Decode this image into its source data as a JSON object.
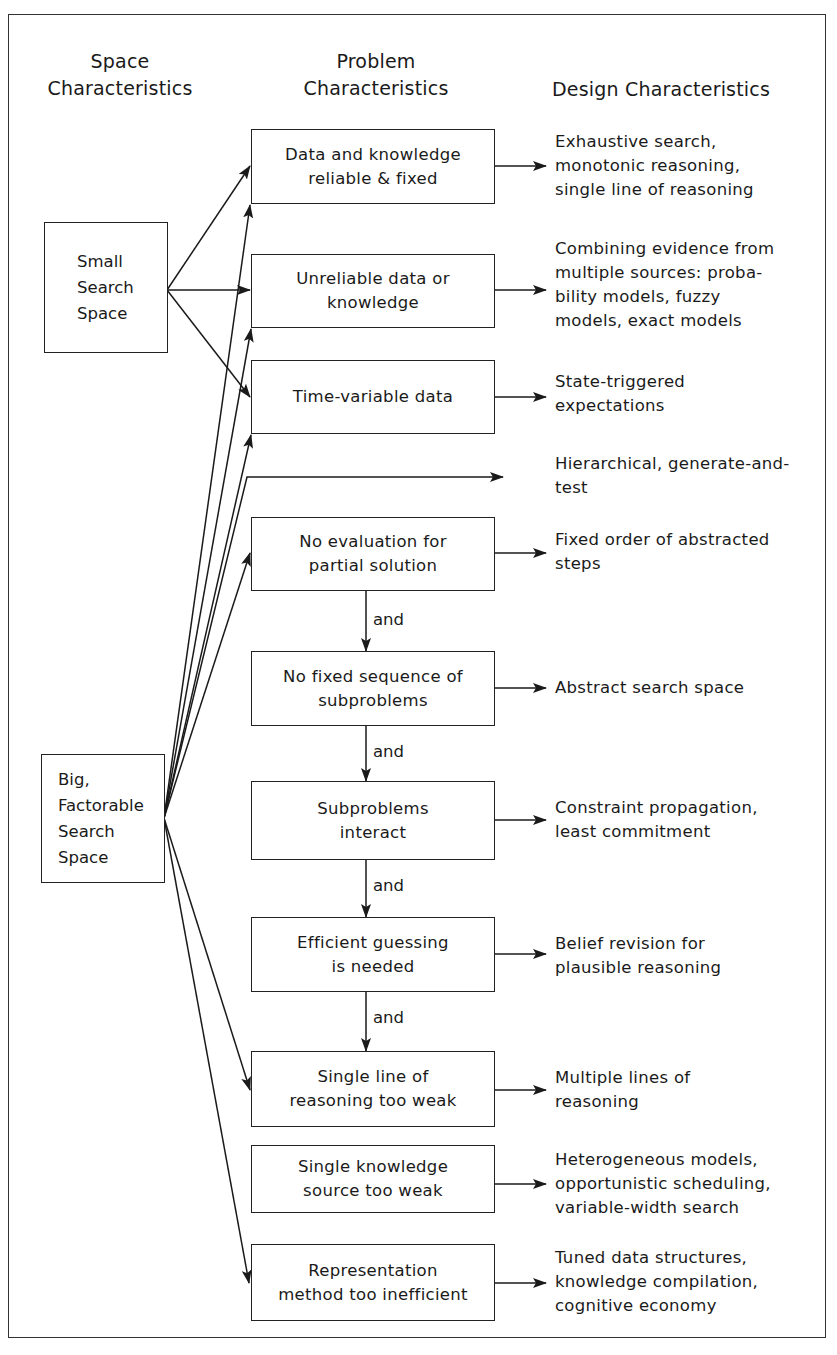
{
  "headers": {
    "space": [
      "Space",
      "Characteristics"
    ],
    "problem": [
      "Problem",
      "Characteristics"
    ],
    "design": "Design Characteristics"
  },
  "space_nodes": [
    {
      "id": "small",
      "lines": [
        "Small",
        "Search",
        "Space"
      ]
    },
    {
      "id": "big",
      "lines": [
        "Big,",
        "Factorable",
        "Search",
        "Space"
      ]
    }
  ],
  "problems": [
    {
      "lines": [
        "Data and knowledge",
        "reliable & fixed"
      ],
      "from": "small"
    },
    {
      "lines": [
        "Unreliable data or",
        "knowledge"
      ],
      "from": "small"
    },
    {
      "lines": [
        "Time-variable data"
      ],
      "from": "small"
    },
    {
      "lines": [
        "No evaluation for",
        "partial solution"
      ],
      "from": "big"
    },
    {
      "lines": [
        "No fixed sequence of",
        "subproblems"
      ],
      "from": "and"
    },
    {
      "lines": [
        "Subproblems",
        "interact"
      ],
      "from": "and"
    },
    {
      "lines": [
        "Efficient guessing",
        "is needed"
      ],
      "from": "and"
    },
    {
      "lines": [
        "Single line of",
        "reasoning too weak"
      ],
      "from": "big+and"
    },
    {
      "lines": [
        "Single knowledge",
        "source too weak"
      ],
      "from": "none"
    },
    {
      "lines": [
        "Representation",
        "method too inefficient"
      ],
      "from": "big"
    }
  ],
  "designs": [
    {
      "lines": [
        "Exhaustive search,",
        "monotonic reasoning,",
        "single line of reasoning"
      ]
    },
    {
      "lines": [
        "Combining evidence from",
        "multiple sources: proba-",
        "bility models, fuzzy",
        "models, exact models"
      ]
    },
    {
      "lines": [
        "State-triggered",
        "expectations"
      ]
    },
    {
      "lines": [
        "Hierarchical, generate-and-",
        "test"
      ]
    },
    {
      "lines": [
        "Fixed order of abstracted",
        "steps"
      ]
    },
    {
      "lines": [
        "Abstract search space"
      ]
    },
    {
      "lines": [
        "Constraint propagation,",
        "least commitment"
      ]
    },
    {
      "lines": [
        "Belief revision for",
        "plausible reasoning"
      ]
    },
    {
      "lines": [
        "Multiple lines of",
        "reasoning"
      ]
    },
    {
      "lines": [
        "Heterogeneous models,",
        "opportunistic scheduling,",
        "variable-width search"
      ]
    },
    {
      "lines": [
        "Tuned data structures,",
        "knowledge compilation,",
        "cognitive economy"
      ]
    }
  ],
  "connector_label": "and",
  "and_labels": [
    "and",
    "and",
    "and",
    "and"
  ]
}
